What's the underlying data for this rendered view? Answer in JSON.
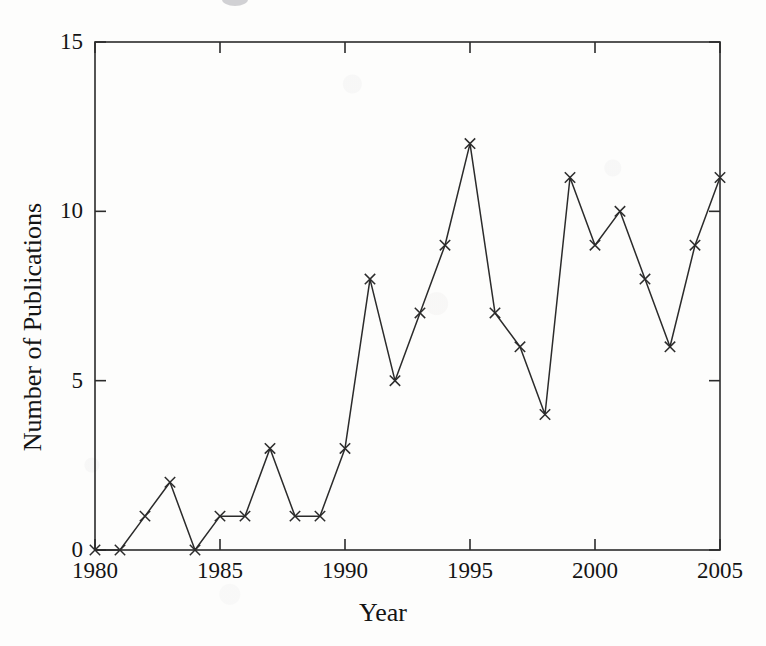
{
  "figure": {
    "background_color": "#fdfdfc",
    "ink_color": "#2b2b2b",
    "marker_symbol": "x"
  },
  "axes": {
    "x_label": "Year",
    "y_label": "Number of Publications",
    "x_tick_labels": [
      "1980",
      "1985",
      "1990",
      "1995",
      "2000",
      "2005"
    ],
    "y_tick_labels": [
      "0",
      "5",
      "10",
      "15"
    ]
  },
  "chart_data": {
    "type": "line",
    "title": "",
    "xlabel": "Year",
    "ylabel": "Number of Publications",
    "x": [
      1980,
      1981,
      1982,
      1983,
      1984,
      1985,
      1986,
      1987,
      1988,
      1989,
      1990,
      1991,
      1992,
      1993,
      1994,
      1995,
      1996,
      1997,
      1998,
      1999,
      2000,
      2001,
      2002,
      2003,
      2004,
      2005
    ],
    "values": [
      0,
      0,
      1,
      2,
      0,
      1,
      1,
      3,
      1,
      1,
      3,
      8,
      5,
      7,
      9,
      12,
      7,
      6,
      4,
      11,
      9,
      10,
      8,
      6,
      9,
      11
    ],
    "series": [
      {
        "name": "Number of Publications",
        "values": [
          0,
          0,
          1,
          2,
          0,
          1,
          1,
          3,
          1,
          1,
          3,
          8,
          5,
          7,
          9,
          12,
          7,
          6,
          4,
          11,
          9,
          10,
          8,
          6,
          9,
          11
        ]
      }
    ],
    "xlim": [
      1980,
      2005
    ],
    "ylim": [
      0,
      15
    ],
    "x_ticks": [
      1980,
      1985,
      1990,
      1995,
      2000,
      2005
    ],
    "y_ticks": [
      0,
      5,
      10,
      15
    ],
    "grid": false,
    "legend": false,
    "marker": "x",
    "line_color": "#2b2b2b"
  }
}
